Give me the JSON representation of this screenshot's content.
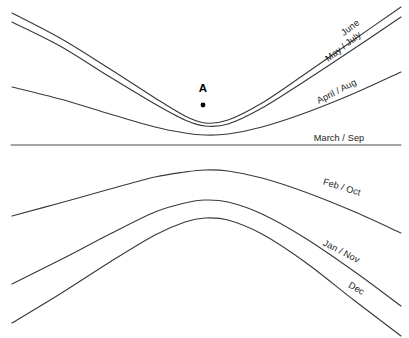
{
  "figure": {
    "width": 409,
    "height": 338,
    "background_color": "#ffffff",
    "line_color": "#3a3a3a",
    "text_color": "#1a1a1a"
  },
  "point_marker": {
    "label": "A",
    "x": 203,
    "y": 105,
    "label_x": 203,
    "label_y": 92
  },
  "chart_data": {
    "type": "line",
    "xlabel": "",
    "ylabel": "",
    "grid": false,
    "legend_position": "right-inline",
    "xlim": [
      12,
      401
    ],
    "ylim": [
      338,
      0
    ],
    "annotations": [
      {
        "text": "A",
        "x": 203,
        "y": 105,
        "style": "bold-point-marker"
      }
    ],
    "series": [
      {
        "name": "June",
        "label": "June",
        "label_rotation": -38,
        "label_x": 352,
        "label_y": 30,
        "shape": "u-curve-upper",
        "points": [
          {
            "x": 12,
            "y": 13
          },
          {
            "x": 60,
            "y": 38
          },
          {
            "x": 110,
            "y": 69
          },
          {
            "x": 155,
            "y": 98
          },
          {
            "x": 185,
            "y": 116
          },
          {
            "x": 205,
            "y": 123
          },
          {
            "x": 228,
            "y": 120
          },
          {
            "x": 262,
            "y": 103
          },
          {
            "x": 305,
            "y": 74
          },
          {
            "x": 355,
            "y": 39
          },
          {
            "x": 401,
            "y": 7
          }
        ]
      },
      {
        "name": "May / July",
        "label": "May / July",
        "label_rotation": -38,
        "label_x": 345,
        "label_y": 49,
        "shape": "u-curve-upper",
        "points": [
          {
            "x": 12,
            "y": 22
          },
          {
            "x": 60,
            "y": 46
          },
          {
            "x": 110,
            "y": 77
          },
          {
            "x": 155,
            "y": 104
          },
          {
            "x": 185,
            "y": 120
          },
          {
            "x": 205,
            "y": 126
          },
          {
            "x": 228,
            "y": 124
          },
          {
            "x": 262,
            "y": 108
          },
          {
            "x": 305,
            "y": 81
          },
          {
            "x": 355,
            "y": 48
          },
          {
            "x": 401,
            "y": 17
          }
        ]
      },
      {
        "name": "April / Aug",
        "label": "April / Aug",
        "label_rotation": -27,
        "label_x": 338,
        "label_y": 94,
        "shape": "u-curve-shallow",
        "points": [
          {
            "x": 12,
            "y": 87
          },
          {
            "x": 60,
            "y": 99
          },
          {
            "x": 110,
            "y": 114
          },
          {
            "x": 155,
            "y": 127
          },
          {
            "x": 185,
            "y": 133
          },
          {
            "x": 205,
            "y": 135
          },
          {
            "x": 228,
            "y": 134
          },
          {
            "x": 262,
            "y": 127
          },
          {
            "x": 305,
            "y": 113
          },
          {
            "x": 355,
            "y": 93
          },
          {
            "x": 401,
            "y": 72
          }
        ]
      },
      {
        "name": "March / Sep",
        "label": "March / Sep",
        "label_rotation": 0,
        "label_x": 339,
        "label_y": 141,
        "shape": "straight-line",
        "points": [
          {
            "x": 11,
            "y": 145
          },
          {
            "x": 401,
            "y": 145
          }
        ]
      },
      {
        "name": "Feb / Oct",
        "label": "Feb / Oct",
        "label_rotation": 17,
        "label_x": 341,
        "label_y": 190,
        "shape": "n-curve-shallow",
        "points": [
          {
            "x": 12,
            "y": 216
          },
          {
            "x": 60,
            "y": 203
          },
          {
            "x": 110,
            "y": 189
          },
          {
            "x": 155,
            "y": 177
          },
          {
            "x": 185,
            "y": 172
          },
          {
            "x": 205,
            "y": 170
          },
          {
            "x": 228,
            "y": 171
          },
          {
            "x": 262,
            "y": 178
          },
          {
            "x": 305,
            "y": 192
          },
          {
            "x": 355,
            "y": 212
          },
          {
            "x": 401,
            "y": 233
          }
        ]
      },
      {
        "name": "Jan / Nov",
        "label": "Jan / Nov",
        "label_rotation": 27,
        "label_x": 340,
        "label_y": 254,
        "shape": "n-curve",
        "points": [
          {
            "x": 12,
            "y": 284
          },
          {
            "x": 60,
            "y": 260
          },
          {
            "x": 110,
            "y": 234
          },
          {
            "x": 155,
            "y": 212
          },
          {
            "x": 185,
            "y": 203
          },
          {
            "x": 205,
            "y": 200
          },
          {
            "x": 228,
            "y": 202
          },
          {
            "x": 262,
            "y": 214
          },
          {
            "x": 305,
            "y": 238
          },
          {
            "x": 355,
            "y": 272
          },
          {
            "x": 401,
            "y": 306
          }
        ]
      },
      {
        "name": "Dec",
        "label": "Dec",
        "label_rotation": 31,
        "label_x": 355,
        "label_y": 291,
        "shape": "n-curve",
        "points": [
          {
            "x": 12,
            "y": 323
          },
          {
            "x": 60,
            "y": 294
          },
          {
            "x": 110,
            "y": 262
          },
          {
            "x": 155,
            "y": 235
          },
          {
            "x": 185,
            "y": 222
          },
          {
            "x": 205,
            "y": 218
          },
          {
            "x": 228,
            "y": 220
          },
          {
            "x": 262,
            "y": 234
          },
          {
            "x": 305,
            "y": 262
          },
          {
            "x": 355,
            "y": 301
          },
          {
            "x": 401,
            "y": 336
          }
        ]
      }
    ]
  }
}
